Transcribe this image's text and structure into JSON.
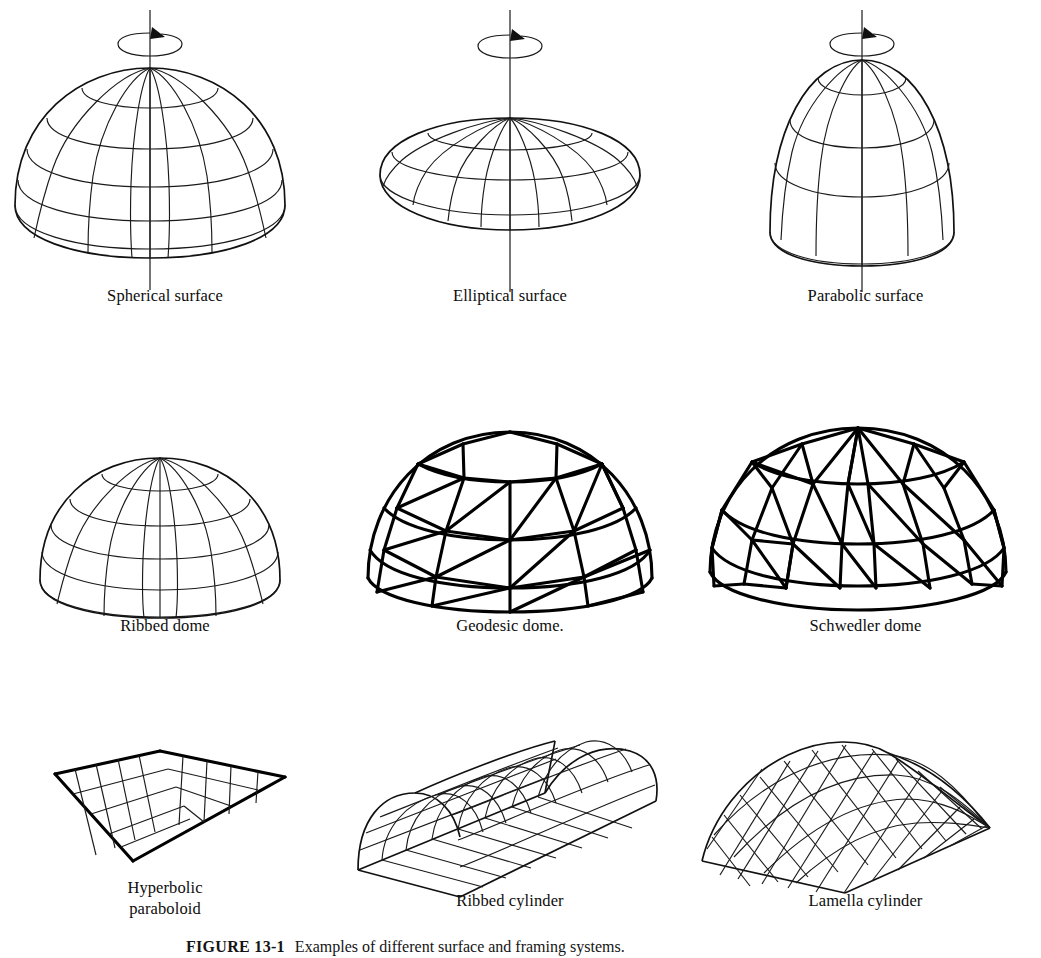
{
  "figure": {
    "page_background": "#ffffff",
    "ink_color": "#111111",
    "caption_number": "FIGURE 13-1",
    "caption_text": "Examples of different surface and framing systems.",
    "rows": 3,
    "columns": 3
  },
  "items": [
    {
      "id": "spherical-surface",
      "label": "Spherical surface",
      "row": 1,
      "column": 1,
      "kind": "surface-of-revolution",
      "has_rotation_axis": true,
      "has_rotation_arrow": true,
      "meridians": 8,
      "parallels": 6,
      "profile": "circular",
      "height_ratio": 0.62
    },
    {
      "id": "elliptical-surface",
      "label": "Elliptical surface",
      "row": 1,
      "column": 2,
      "kind": "surface-of-revolution",
      "has_rotation_axis": true,
      "has_rotation_arrow": true,
      "meridians": 10,
      "parallels": 3,
      "profile": "elliptical-shallow",
      "height_ratio": 0.3
    },
    {
      "id": "parabolic-surface",
      "label": "Parabolic surface",
      "row": 1,
      "column": 3,
      "kind": "surface-of-revolution",
      "has_rotation_axis": true,
      "has_rotation_arrow": true,
      "meridians": 8,
      "parallels": 4,
      "profile": "parabolic",
      "height_ratio": 0.78
    },
    {
      "id": "ribbed-dome",
      "label": "Ribbed dome",
      "row": 2,
      "column": 1,
      "kind": "framed-dome",
      "has_rotation_axis": false,
      "has_rotation_arrow": false,
      "meridians": 8,
      "parallels": 6,
      "framing": "meridional ribs with horizontal rings"
    },
    {
      "id": "geodesic-dome",
      "label": "Geodesic dome.",
      "row": 2,
      "column": 2,
      "kind": "framed-dome",
      "has_rotation_axis": false,
      "has_rotation_arrow": false,
      "framing": "triangulated geodesic lattice",
      "rings": 4
    },
    {
      "id": "schwedler-dome",
      "label": "Schwedler dome",
      "row": 2,
      "column": 3,
      "kind": "framed-dome",
      "has_rotation_axis": false,
      "has_rotation_arrow": false,
      "framing": "meridians, rings and single diagonal in each panel",
      "meridians": 12,
      "rings": 4
    },
    {
      "id": "hyperbolic-paraboloid",
      "label": "Hyperbolic\nparaboloid",
      "label_lines": [
        "Hyperbolic",
        "paraboloid"
      ],
      "row": 3,
      "column": 1,
      "kind": "saddle-surface",
      "framing": "orthogonal straight-line grid",
      "grid_u": 6,
      "grid_v": 5
    },
    {
      "id": "ribbed-cylinder",
      "label": "Ribbed cylinder",
      "row": 3,
      "column": 2,
      "kind": "barrel-vault",
      "framing": "transverse arched ribs with longitudinal purlins",
      "ribs": 8,
      "purlins": 7
    },
    {
      "id": "lamella-cylinder",
      "label": "Lamella cylinder",
      "row": 3,
      "column": 3,
      "kind": "barrel-vault",
      "framing": "diagonal lamella diamond network",
      "diagonals_each_way": 14
    }
  ]
}
